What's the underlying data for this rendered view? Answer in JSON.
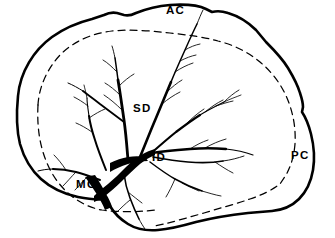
{
  "figure": {
    "background_color": "#ffffff",
    "ink_color": "#000000",
    "width": 335,
    "height": 238
  },
  "labels": {
    "ac": "AC",
    "sd": "SD",
    "id": "ID",
    "mc": "MC",
    "pc": "PC"
  },
  "structures": {
    "outline_name": "cerebral-hemisphere-outline",
    "dashed_name": "dashed-boundary-line",
    "vessel_trunk_name": "middle-cerebral-artery-trunk",
    "vessel_tree_name": "arterial-branch-tree"
  }
}
